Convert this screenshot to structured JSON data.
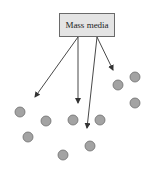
{
  "diagram": {
    "source_label": "Mass media",
    "colors": {
      "box_fill": "#e4e4e4",
      "box_border": "#6a6a6a",
      "node_fill": "#a3a3a3",
      "node_border": "#6e6e6e",
      "arrow": "#333333"
    },
    "arrows": [
      {
        "x1": 78,
        "y1": 37,
        "x2": 35,
        "y2": 97
      },
      {
        "x1": 78,
        "y1": 37,
        "x2": 78,
        "y2": 103
      },
      {
        "x1": 97,
        "y1": 37,
        "x2": 87,
        "y2": 128
      },
      {
        "x1": 97,
        "y1": 37,
        "x2": 113,
        "y2": 70
      }
    ],
    "nodes": [
      {
        "cx": 20,
        "cy": 112
      },
      {
        "cx": 46,
        "cy": 121
      },
      {
        "cx": 28,
        "cy": 137
      },
      {
        "cx": 73,
        "cy": 120
      },
      {
        "cx": 100,
        "cy": 120
      },
      {
        "cx": 90,
        "cy": 146
      },
      {
        "cx": 63,
        "cy": 155
      },
      {
        "cx": 118,
        "cy": 85
      },
      {
        "cx": 135,
        "cy": 77
      },
      {
        "cx": 135,
        "cy": 103
      }
    ]
  }
}
